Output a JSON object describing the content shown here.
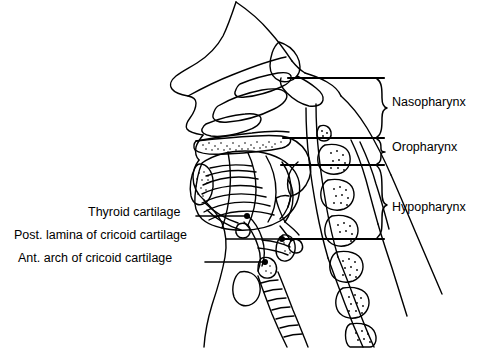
{
  "figure": {
    "type": "anatomical-line-drawing",
    "view": "midsagittal section of head and neck",
    "background_color": "#ffffff",
    "line_color": "#000000"
  },
  "right_labels": [
    {
      "id": "nasopharynx",
      "text": "Nasopharynx",
      "x": 392,
      "y": 103,
      "brace_top": 78,
      "brace_bottom": 138
    },
    {
      "id": "oropharynx",
      "text": "Oropharynx",
      "x": 392,
      "y": 148,
      "brace_top": 138,
      "brace_bottom": 165
    },
    {
      "id": "hypopharynx",
      "text": "Hypopharynx",
      "x": 392,
      "y": 208,
      "brace_top": 165,
      "brace_bottom": 239
    }
  ],
  "left_labels": [
    {
      "id": "thyroid-cartilage",
      "text": "Thyroid cartilage",
      "x": 88,
      "y": 212,
      "line_from_x": 196,
      "line_to_x": 245,
      "line_y": 216,
      "dot_x": 248,
      "dot_y": 216
    },
    {
      "id": "post-lamina-cricoid",
      "text": "Post. lamina of cricoid cartilage",
      "x": 14,
      "y": 235,
      "line_from_x": 226,
      "line_to_x": 280,
      "line_y": 239,
      "dot_x": 283,
      "dot_y": 239
    },
    {
      "id": "ant-arch-cricoid",
      "text": "Ant. arch of cricoid cartilage",
      "x": 18,
      "y": 258,
      "line_from_x": 205,
      "line_to_x": 263,
      "line_y": 262,
      "dot_x": 266,
      "dot_y": 262
    }
  ],
  "leader_lines": [
    {
      "id": "nasopharynx-leader",
      "x1": 288,
      "y1": 78,
      "x2": 384,
      "y2": 78
    },
    {
      "id": "oropharynx-leader",
      "x1": 283,
      "y1": 138,
      "x2": 384,
      "y2": 138
    },
    {
      "id": "hypopharynx-leader",
      "x1": 281,
      "y1": 165,
      "x2": 384,
      "y2": 165
    },
    {
      "id": "hypopharynx-lower-leader",
      "x1": 283,
      "y1": 239,
      "x2": 384,
      "y2": 239
    }
  ]
}
